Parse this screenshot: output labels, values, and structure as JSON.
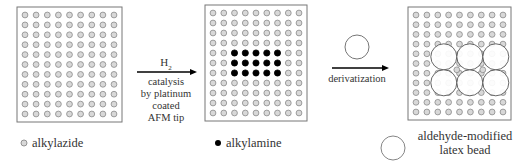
{
  "diagram": {
    "panels": [
      {
        "id": "alkylazide-surface",
        "cols": 9,
        "rows": 11,
        "box": [
          17,
          7,
          105,
          115
        ]
      },
      {
        "id": "patterned-surface",
        "cols": 9,
        "rows": 11,
        "box": [
          205,
          5,
          102,
          116
        ],
        "filled_region": {
          "rows": [
            4,
            6
          ],
          "cols": [
            2,
            6
          ]
        }
      },
      {
        "id": "bead-surface",
        "cols": 9,
        "rows": 11,
        "box": [
          408,
          7,
          103,
          113
        ],
        "beads": {
          "rows": 2,
          "cols": 3
        }
      }
    ],
    "step1": {
      "reagent": "H",
      "reagent_subscript": "2",
      "caption_lines": [
        "catalysis",
        "by platinum",
        "coated",
        "AFM tip"
      ]
    },
    "step2": {
      "caption": "derivatization"
    },
    "legend": {
      "alkylazide": "alkylazide",
      "alkylamine": "alkylamine",
      "bead_line1": "aldehyde-modified",
      "bead_line2": "latex bead"
    },
    "colors": {
      "open_dot_stroke": "#8a8a8a",
      "open_dot_fill": "#d8d8d8",
      "filled_dot": "#000000",
      "box_stroke": "#777777",
      "arrow": "#000000"
    }
  }
}
